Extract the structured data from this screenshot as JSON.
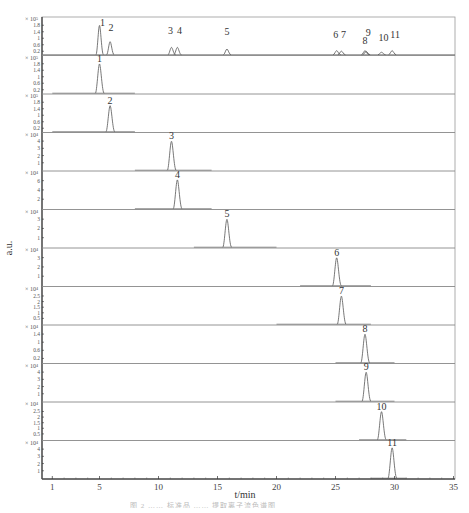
{
  "chart_data": {
    "type": "line",
    "title": "",
    "xlabel": "t/min",
    "ylabel": "a.u.",
    "xlim": [
      0,
      35
    ],
    "x_ticks": [
      1,
      5,
      10,
      15,
      20,
      25,
      30,
      35
    ],
    "grid": false,
    "legend": null,
    "panels": [
      {
        "name": "mixture",
        "exponent": "× 10⁵",
        "y_ticks": [
          "1.8",
          "1.4",
          "1",
          "0.6",
          "0.2"
        ],
        "ymax": 2.0,
        "peaks": [
          {
            "label": "1",
            "t": 5.0,
            "h": 1.8
          },
          {
            "label": "2",
            "t": 5.9,
            "h": 0.8
          },
          {
            "label": "3",
            "t": 11.1,
            "h": 0.45
          },
          {
            "label": "4",
            "t": 11.6,
            "h": 0.45
          },
          {
            "label": "5",
            "t": 15.8,
            "h": 0.35
          },
          {
            "label": "6",
            "t": 25.1,
            "h": 0.25
          },
          {
            "label": "7",
            "t": 25.5,
            "h": 0.22
          },
          {
            "label": "8",
            "t": 27.5,
            "h": 0.25
          },
          {
            "label": "9",
            "t": 27.6,
            "h": 0.2
          },
          {
            "label": "10",
            "t": 28.9,
            "h": 0.15
          },
          {
            "label": "11",
            "t": 29.8,
            "h": 0.25
          }
        ]
      },
      {
        "name": "compound-1",
        "exponent": "× 10⁵",
        "y_ticks": [
          "1.8",
          "1.4",
          "1",
          "0.6",
          "0.2"
        ],
        "ymax": 2.0,
        "baseline": [
          1,
          8
        ],
        "peaks": [
          {
            "label": "1",
            "t": 5.0,
            "h": 1.8
          }
        ]
      },
      {
        "name": "compound-2",
        "exponent": "× 10⁵",
        "y_ticks": [
          "1.8",
          "1.4",
          "1",
          "0.6",
          "0.2"
        ],
        "ymax": 2.0,
        "baseline": [
          1,
          8
        ],
        "peaks": [
          {
            "label": "2",
            "t": 5.9,
            "h": 1.6
          }
        ]
      },
      {
        "name": "compound-3",
        "exponent": "× 10⁴",
        "y_ticks": [
          "4",
          "3",
          "2",
          "1"
        ],
        "ymax": 4.5,
        "baseline": [
          8,
          14.5
        ],
        "peaks": [
          {
            "label": "3",
            "t": 11.1,
            "h": 4.0
          }
        ]
      },
      {
        "name": "compound-4",
        "exponent": "× 10⁴",
        "y_ticks": [
          "6",
          "4",
          "2"
        ],
        "ymax": 7,
        "baseline": [
          8,
          14.5
        ],
        "peaks": [
          {
            "label": "4",
            "t": 11.6,
            "h": 6.2
          }
        ]
      },
      {
        "name": "compound-5",
        "exponent": "× 10⁴",
        "y_ticks": [
          "3",
          "2",
          "1"
        ],
        "ymax": 3.5,
        "baseline": [
          13,
          20
        ],
        "peaks": [
          {
            "label": "5",
            "t": 15.8,
            "h": 3.0
          }
        ]
      },
      {
        "name": "compound-6",
        "exponent": "× 10⁴",
        "y_ticks": [
          "3",
          "2",
          "1"
        ],
        "ymax": 3.5,
        "baseline": [
          22,
          28
        ],
        "peaks": [
          {
            "label": "6",
            "t": 25.1,
            "h": 3.0
          }
        ]
      },
      {
        "name": "compound-7",
        "exponent": "× 10⁴",
        "y_ticks": [
          "2.5",
          "2",
          "1.5",
          "1",
          "0.5"
        ],
        "ymax": 2.9,
        "baseline": [
          20,
          28
        ],
        "peaks": [
          {
            "label": "7",
            "t": 25.5,
            "h": 2.5
          }
        ]
      },
      {
        "name": "compound-8",
        "exponent": "× 10⁴",
        "y_ticks": [
          "1.4",
          "1",
          "0.6",
          "0.2"
        ],
        "ymax": 1.6,
        "baseline": [
          25,
          30
        ],
        "peaks": [
          {
            "label": "8",
            "t": 27.5,
            "h": 1.4
          }
        ]
      },
      {
        "name": "compound-9",
        "exponent": "× 10⁴",
        "y_ticks": [
          "4",
          "3",
          "2",
          "1"
        ],
        "ymax": 4.5,
        "baseline": [
          25,
          30
        ],
        "peaks": [
          {
            "label": "9",
            "t": 27.6,
            "h": 4.0
          }
        ]
      },
      {
        "name": "compound-10",
        "exponent": "× 10⁴",
        "y_ticks": [
          "2.5",
          "2",
          "1.5",
          "1",
          "0.5"
        ],
        "ymax": 2.9,
        "baseline": [
          27,
          31
        ],
        "peaks": [
          {
            "label": "10",
            "t": 28.9,
            "h": 2.5
          }
        ]
      },
      {
        "name": "compound-11",
        "exponent": "× 10⁴",
        "y_ticks": [
          "4",
          "3",
          "2",
          "1"
        ],
        "ymax": 4.5,
        "baseline": [
          28,
          31
        ],
        "peaks": [
          {
            "label": "11",
            "t": 29.8,
            "h": 4.2
          }
        ]
      }
    ]
  },
  "axes": {
    "xlabel": "t/min",
    "ylabel": "a.u."
  },
  "caption": "图 2  …… 标准品 …… 提取离子流色谱图"
}
